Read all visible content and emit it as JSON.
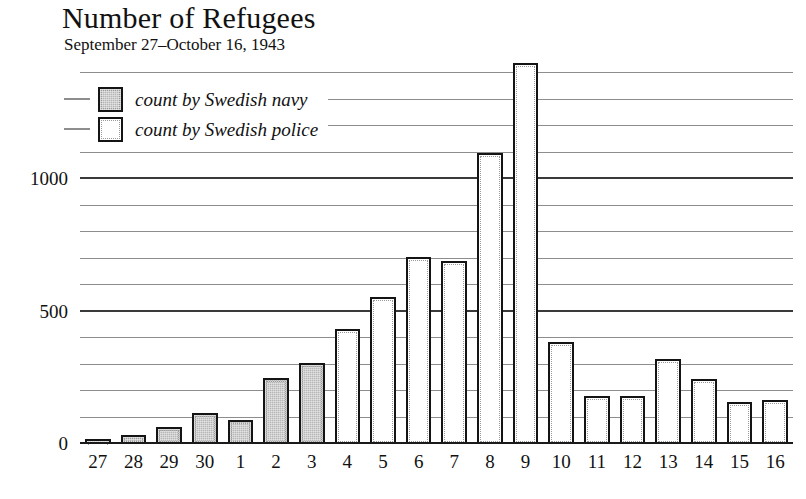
{
  "header": {
    "title": "Number of Refugees",
    "subtitle": "September 27–October 16, 1943"
  },
  "legend": {
    "items": [
      {
        "label": "count by Swedish navy",
        "series": "navy",
        "swatch": "gray-filled-square"
      },
      {
        "label": "count by Swedish police",
        "series": "police",
        "swatch": "white-square"
      }
    ]
  },
  "axes": {
    "y_tick_labels": [
      "0",
      "500",
      "1000"
    ],
    "x_tick_labels": [
      "27",
      "28",
      "29",
      "30",
      "1",
      "2",
      "3",
      "4",
      "5",
      "6",
      "7",
      "8",
      "9",
      "10",
      "11",
      "12",
      "13",
      "14",
      "15",
      "16"
    ]
  },
  "colors": {
    "navy_fill": "#b6b6b6",
    "police_fill": "#ffffff",
    "bar_outline": "#141414",
    "gridline": "#8d8d8d",
    "gridline_major": "#3a3a3a",
    "text": "#111111"
  },
  "chart_data": {
    "type": "bar",
    "title": "Number of Refugees",
    "subtitle": "September 27–October 16, 1943",
    "xlabel": "",
    "ylabel": "",
    "ylim": [
      0,
      1450
    ],
    "yticks": [
      0,
      500,
      1000
    ],
    "gridlines": [
      0,
      100,
      200,
      300,
      400,
      500,
      600,
      700,
      800,
      900,
      1000,
      1100,
      1200,
      1300,
      1400
    ],
    "grid": true,
    "legend_position": "top-left",
    "categories": [
      "27",
      "28",
      "29",
      "30",
      "1",
      "2",
      "3",
      "4",
      "5",
      "6",
      "7",
      "8",
      "9",
      "10",
      "11",
      "12",
      "13",
      "14",
      "15",
      "16"
    ],
    "series": [
      {
        "name": "count by Swedish navy",
        "values": [
          18,
          35,
          65,
          118,
          90,
          250,
          305,
          null,
          null,
          null,
          null,
          null,
          null,
          null,
          null,
          null,
          null,
          null,
          null,
          null
        ]
      },
      {
        "name": "count by Swedish police",
        "values": [
          null,
          null,
          null,
          null,
          null,
          null,
          null,
          435,
          555,
          705,
          690,
          1100,
          1440,
          385,
          180,
          180,
          320,
          245,
          160,
          165
        ]
      }
    ],
    "bars": [
      {
        "category": "27",
        "value": 18,
        "series": "navy"
      },
      {
        "category": "28",
        "value": 35,
        "series": "navy"
      },
      {
        "category": "29",
        "value": 65,
        "series": "navy"
      },
      {
        "category": "30",
        "value": 118,
        "series": "navy"
      },
      {
        "category": "1",
        "value": 90,
        "series": "navy"
      },
      {
        "category": "2",
        "value": 250,
        "series": "navy"
      },
      {
        "category": "3",
        "value": 305,
        "series": "navy"
      },
      {
        "category": "4",
        "value": 435,
        "series": "police"
      },
      {
        "category": "5",
        "value": 555,
        "series": "police"
      },
      {
        "category": "6",
        "value": 705,
        "series": "police"
      },
      {
        "category": "7",
        "value": 690,
        "series": "police"
      },
      {
        "category": "8",
        "value": 1100,
        "series": "police"
      },
      {
        "category": "9",
        "value": 1440,
        "series": "police"
      },
      {
        "category": "10",
        "value": 385,
        "series": "police"
      },
      {
        "category": "11",
        "value": 180,
        "series": "police"
      },
      {
        "category": "12",
        "value": 180,
        "series": "police"
      },
      {
        "category": "13",
        "value": 320,
        "series": "police"
      },
      {
        "category": "14",
        "value": 245,
        "series": "police"
      },
      {
        "category": "15",
        "value": 160,
        "series": "police"
      },
      {
        "category": "16",
        "value": 165,
        "series": "police"
      }
    ]
  }
}
